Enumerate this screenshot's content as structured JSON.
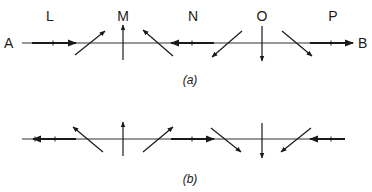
{
  "figure": {
    "colors": {
      "ink": "#1a1a1a",
      "background": "#ffffff"
    },
    "panel_a": {
      "caption": "(a)",
      "left_end_label": "A",
      "right_end_label": "B",
      "point_labels": [
        {
          "id": "L",
          "label": "L"
        },
        {
          "id": "M",
          "label": "M"
        },
        {
          "id": "N",
          "label": "N"
        },
        {
          "id": "O",
          "label": "O"
        },
        {
          "id": "P",
          "label": "P"
        }
      ],
      "arrows": [
        {
          "at": "L",
          "type": "horizontal",
          "direction": "right"
        },
        {
          "at": "L-M",
          "type": "diagonal",
          "direction": "up-right"
        },
        {
          "at": "M",
          "type": "vertical",
          "direction": "up"
        },
        {
          "at": "M-N",
          "type": "diagonal",
          "direction": "up-left"
        },
        {
          "at": "N",
          "type": "horizontal",
          "direction": "left"
        },
        {
          "at": "N-O",
          "type": "diagonal",
          "direction": "down-left"
        },
        {
          "at": "O",
          "type": "vertical",
          "direction": "down"
        },
        {
          "at": "O-P",
          "type": "diagonal",
          "direction": "down-right"
        },
        {
          "at": "P",
          "type": "horizontal",
          "direction": "right"
        }
      ]
    },
    "panel_b": {
      "caption": "(b)",
      "arrows": [
        {
          "at": "L",
          "type": "horizontal",
          "direction": "left"
        },
        {
          "at": "L-M",
          "type": "diagonal",
          "direction": "up-left"
        },
        {
          "at": "M",
          "type": "vertical",
          "direction": "up"
        },
        {
          "at": "M-N",
          "type": "diagonal",
          "direction": "up-right"
        },
        {
          "at": "N",
          "type": "horizontal",
          "direction": "right"
        },
        {
          "at": "N-O",
          "type": "diagonal",
          "direction": "down-right"
        },
        {
          "at": "O",
          "type": "vertical",
          "direction": "down"
        },
        {
          "at": "O-P",
          "type": "diagonal",
          "direction": "down-left"
        },
        {
          "at": "P",
          "type": "horizontal",
          "direction": "left"
        }
      ]
    }
  }
}
